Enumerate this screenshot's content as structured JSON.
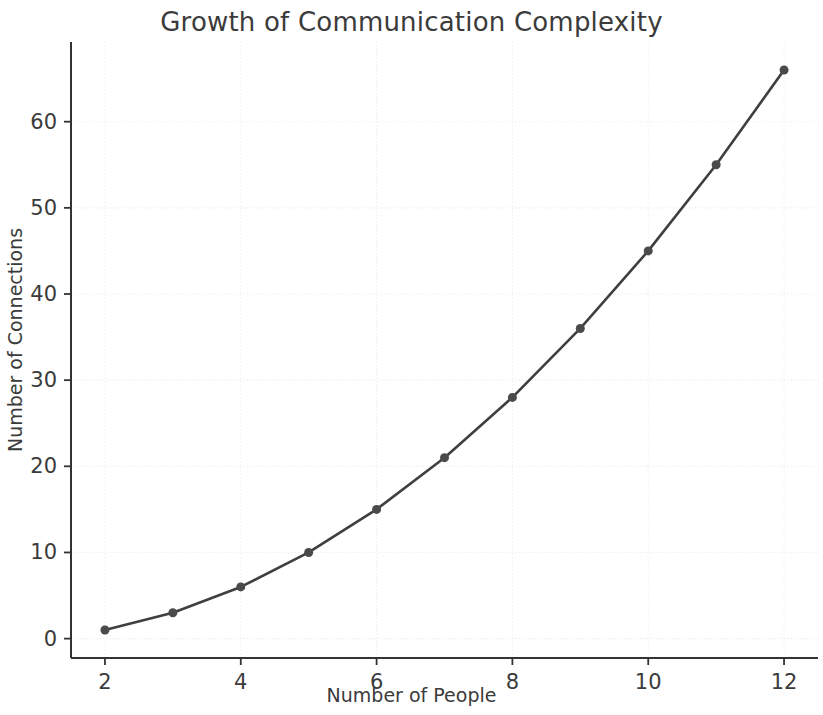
{
  "chart_data": {
    "type": "line",
    "title": "Growth of Communication Complexity",
    "xlabel": "Number of People",
    "ylabel": "Number of Connections",
    "x": [
      2,
      3,
      4,
      5,
      6,
      7,
      8,
      9,
      10,
      11,
      12
    ],
    "values": [
      1,
      3,
      6,
      10,
      15,
      21,
      28,
      36,
      45,
      55,
      66
    ],
    "series": [
      {
        "name": "Connections",
        "values": [
          1,
          3,
          6,
          10,
          15,
          21,
          28,
          36,
          45,
          55,
          66
        ]
      }
    ],
    "xticks": [
      "2",
      "4",
      "6",
      "8",
      "10",
      "12"
    ],
    "xtick_values": [
      2,
      4,
      6,
      8,
      10,
      12
    ],
    "yticks": [
      "0",
      "10",
      "20",
      "30",
      "40",
      "50",
      "60"
    ],
    "ytick_values": [
      0,
      10,
      20,
      30,
      40,
      50,
      60
    ],
    "xlim": [
      1.5,
      12.5
    ],
    "ylim": [
      -2.25,
      69.25
    ],
    "grid": true,
    "legend": null,
    "line_color": "#3f3f3f",
    "marker_color": "#4a4a4a",
    "grid_color": "#e9e9e9",
    "axis_color": "#333333",
    "background_color": "#ffffff",
    "marker": "circle",
    "linewidth": 2.6,
    "markersize": 9
  },
  "figure": {
    "title": "Growth of Communication Complexity",
    "xlabel": "Number of People",
    "ylabel": "Number of Connections"
  }
}
